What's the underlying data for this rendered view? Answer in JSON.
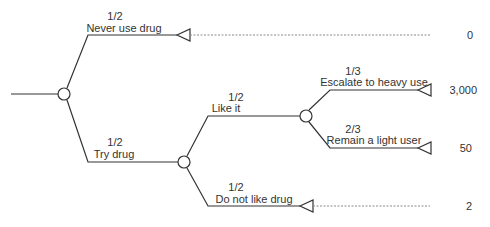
{
  "diagram": {
    "type": "decision-tree",
    "branches": {
      "never_use": {
        "prob": "1/2",
        "label": "Never use drug",
        "payoff": "0"
      },
      "try_drug": {
        "prob": "1/2",
        "label": "Try drug"
      },
      "like_it": {
        "prob": "1/2",
        "label": "Like it"
      },
      "escalate": {
        "prob": "1/3",
        "label": "Escalate to heavy use",
        "payoff": "3,000"
      },
      "remain_light": {
        "prob": "2/3",
        "label": "Remain a light user",
        "payoff": "50"
      },
      "do_not_like": {
        "prob": "1/2",
        "label": "Do not like drug",
        "payoff": "2"
      }
    },
    "colors": {
      "line": "#333333",
      "dotted": "#888888",
      "background": "#ffffff"
    }
  }
}
